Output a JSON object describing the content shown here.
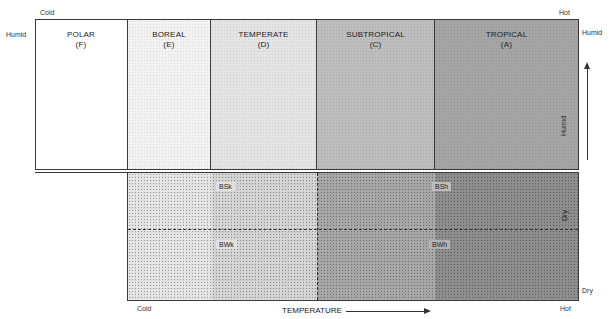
{
  "diagram": {
    "type": "climate-classification-temperature-moisture",
    "corner_labels": {
      "top_left": "Cold",
      "top_right": "Hot",
      "left_humid": "Humid",
      "right_humid": "Humid",
      "bottom_left": "Cold",
      "bottom_right": "Hot",
      "right_dry": "Dry"
    },
    "zones": [
      {
        "name": "POLAR",
        "code": "(F)",
        "color": "#ffffff"
      },
      {
        "name": "BOREAL",
        "code": "(E)",
        "color": "#f2f2f2"
      },
      {
        "name": "TEMPERATE",
        "code": "(D)",
        "color": "#e4e4e4"
      },
      {
        "name": "SUBTROPICAL",
        "code": "(C)",
        "color": "#bdbdbd"
      },
      {
        "name": "TROPICAL",
        "code": "(A)",
        "color": "#a5a5a5"
      }
    ],
    "dry_subtypes": [
      {
        "code": "BSk",
        "position": "upper-cold"
      },
      {
        "code": "BWk",
        "position": "lower-cold"
      },
      {
        "code": "BSh",
        "position": "upper-hot"
      },
      {
        "code": "BWh",
        "position": "lower-hot"
      }
    ],
    "moisture_axis": {
      "humid_label": "Humid",
      "dry_label": "Dry",
      "arrow": "up"
    },
    "temperature_axis": {
      "label": "TEMPERATURE",
      "arrow": "right"
    }
  }
}
